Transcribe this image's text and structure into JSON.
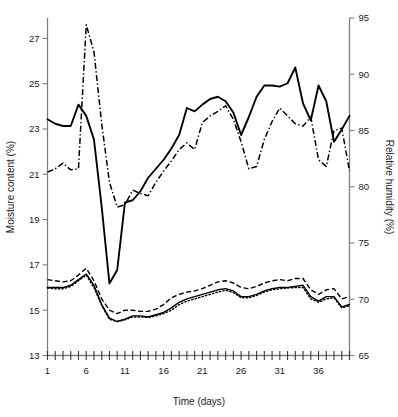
{
  "chart_data": {
    "type": "line",
    "title": "",
    "xlabel": "Time (days)",
    "ylabel": "Moisture content (%)",
    "y2label": "Relative humidity (%)",
    "xlim": [
      1,
      40
    ],
    "ylim": [
      13,
      27.9
    ],
    "y2lim": [
      65,
      95
    ],
    "grid": false,
    "legend_position": "none",
    "x_ticks_major": [
      1,
      6,
      11,
      16,
      21,
      26,
      31,
      36
    ],
    "x_tick_labels": [
      "1",
      "6",
      "11",
      "16",
      "21",
      "26",
      "31",
      "36"
    ],
    "x_ticks_minor_count": 40,
    "y_ticks": [
      13,
      15,
      17,
      19,
      21,
      23,
      25,
      27
    ],
    "y_tick_labels": [
      "13",
      "15",
      "17",
      "19",
      "21",
      "23",
      "25",
      "27"
    ],
    "y2_ticks": [
      65,
      70,
      75,
      80,
      85,
      90,
      95
    ],
    "y2_tick_labels": [
      "65",
      "70",
      "75",
      "80",
      "85",
      "90",
      "95"
    ],
    "x": [
      1,
      2,
      3,
      4,
      5,
      6,
      7,
      8,
      9,
      10,
      11,
      12,
      13,
      14,
      15,
      16,
      17,
      18,
      19,
      20,
      21,
      22,
      23,
      24,
      25,
      26,
      27,
      28,
      29,
      30,
      31,
      32,
      33,
      34,
      35,
      36,
      37,
      38,
      39,
      40
    ],
    "series": [
      {
        "name": "relative-humidity-solid",
        "axis": "y2",
        "style": "solid",
        "values": [
          86.0,
          85.6,
          85.4,
          85.4,
          87.3,
          86.3,
          84.2,
          78.2,
          71.4,
          72.6,
          78.6,
          78.8,
          79.6,
          80.8,
          81.6,
          82.4,
          83.4,
          84.6,
          87.0,
          86.7,
          87.3,
          87.8,
          88.0,
          87.6,
          86.6,
          84.6,
          86.2,
          88.0,
          89.0,
          89.0,
          88.9,
          89.2,
          90.6,
          87.4,
          85.9,
          89.0,
          87.6,
          84.0,
          85.1,
          86.3
        ]
      },
      {
        "name": "relative-humidity-dash-dot",
        "axis": "y2",
        "style": "dash-dot",
        "values": [
          81.3,
          81.6,
          82.1,
          81.5,
          81.6,
          94.4,
          92.0,
          85.6,
          80.4,
          78.2,
          78.4,
          79.7,
          79.4,
          79.2,
          80.4,
          81.4,
          82.3,
          83.3,
          83.9,
          83.3,
          85.7,
          86.3,
          86.7,
          87.2,
          86.0,
          84.0,
          81.6,
          81.8,
          84.2,
          85.8,
          87.0,
          86.3,
          85.6,
          85.4,
          86.2,
          82.4,
          81.8,
          85.0,
          85.2,
          81.4
        ]
      },
      {
        "name": "moisture-content-dashed",
        "axis": "y1",
        "style": "dashed",
        "values": [
          16.35,
          16.3,
          16.25,
          16.3,
          16.55,
          16.85,
          16.3,
          15.5,
          15.0,
          14.85,
          15.0,
          15.0,
          14.95,
          14.95,
          15.05,
          15.25,
          15.55,
          15.7,
          15.8,
          15.85,
          15.95,
          16.1,
          16.25,
          16.3,
          16.2,
          16.0,
          15.95,
          16.05,
          16.2,
          16.3,
          16.35,
          16.3,
          16.4,
          16.4,
          15.9,
          15.7,
          15.9,
          15.95,
          15.5,
          15.6
        ]
      },
      {
        "name": "moisture-content-solid",
        "axis": "y1",
        "style": "solid-thin",
        "values": [
          16.0,
          16.0,
          16.0,
          16.1,
          16.35,
          16.6,
          16.1,
          15.25,
          14.65,
          14.5,
          14.6,
          14.75,
          14.75,
          14.7,
          14.8,
          14.9,
          15.1,
          15.35,
          15.5,
          15.6,
          15.7,
          15.8,
          15.9,
          15.95,
          15.85,
          15.6,
          15.6,
          15.7,
          15.85,
          15.95,
          16.0,
          16.0,
          16.05,
          16.1,
          15.6,
          15.4,
          15.6,
          15.6,
          15.15,
          15.25
        ]
      },
      {
        "name": "moisture-content-dotted",
        "axis": "y1",
        "style": "dotted",
        "values": [
          15.98,
          15.95,
          15.95,
          16.05,
          16.3,
          16.55,
          16.0,
          15.2,
          14.6,
          14.5,
          14.58,
          14.7,
          14.7,
          14.68,
          14.75,
          14.85,
          15.0,
          15.25,
          15.4,
          15.5,
          15.6,
          15.7,
          15.8,
          15.88,
          15.78,
          15.55,
          15.55,
          15.65,
          15.8,
          15.9,
          15.95,
          15.98,
          16.0,
          16.0,
          15.5,
          15.35,
          15.5,
          15.55,
          15.1,
          15.2
        ]
      }
    ]
  },
  "axes": {
    "x_title": "Time (days)",
    "y_left_title": "Moisture content (%)",
    "y_right_title": "Relative humidity (%)"
  }
}
